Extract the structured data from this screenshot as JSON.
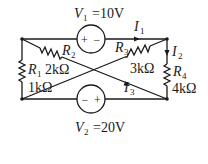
{
  "diagram": {
    "type": "circuit",
    "sources": [
      {
        "id": "V1",
        "name": "V",
        "sub": "1",
        "value": "=10V",
        "polarity": "+ −",
        "plus": "+",
        "minus": "−"
      },
      {
        "id": "V2",
        "name": "V",
        "sub": "2",
        "value": "=20V",
        "polarity": "− +",
        "plus": "+",
        "minus": "−"
      }
    ],
    "resistors": [
      {
        "id": "R1",
        "name": "R",
        "sub": "1",
        "value": "1kΩ"
      },
      {
        "id": "R2",
        "name": "R",
        "sub": "2",
        "value": "2kΩ"
      },
      {
        "id": "R3",
        "name": "R",
        "sub": "3",
        "value": "3kΩ"
      },
      {
        "id": "R4",
        "name": "R",
        "sub": "4",
        "value": "4kΩ"
      }
    ],
    "currents": [
      {
        "id": "I1",
        "name": "I",
        "sub": "1"
      },
      {
        "id": "I2",
        "name": "I",
        "sub": "2"
      },
      {
        "id": "I3",
        "name": "I",
        "sub": "3"
      }
    ]
  }
}
